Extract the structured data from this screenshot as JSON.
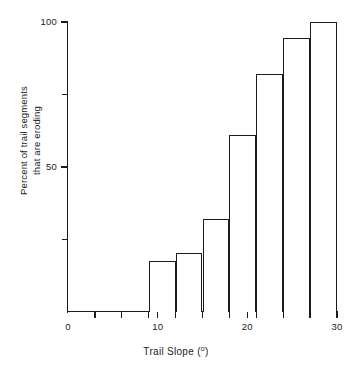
{
  "chart_data": {
    "type": "bar",
    "title": "",
    "xlabel": "Trail Slope (º)",
    "ylabel": "Percent of trail segments that are eroding",
    "ylabel_line1": "Percent of trail segments",
    "ylabel_line2": "that are eroding",
    "xlabel_text": "Trail Slope (",
    "xlabel_sup": "o",
    "xlabel_close": ")",
    "xlim": [
      0,
      30
    ],
    "ylim": [
      0,
      100
    ],
    "grid": false,
    "legend": null,
    "bin_width": 3,
    "x_tick_labels": [
      "0",
      "10",
      "20",
      "30"
    ],
    "x_tick_values": [
      0,
      10,
      20,
      30
    ],
    "x_minor_ticks": [
      3,
      6,
      9,
      12,
      15,
      18,
      21,
      24,
      27
    ],
    "y_tick_labels": [
      "100",
      "50"
    ],
    "y_tick_values": [
      100,
      50
    ],
    "y_minor_ticks": [
      75,
      25
    ],
    "categories": [
      "9-12",
      "12-15",
      "15-18",
      "18-21",
      "21-24",
      "24-27",
      "27-30"
    ],
    "bins": [
      {
        "x0": 9,
        "x1": 12,
        "value": 17.5
      },
      {
        "x0": 12,
        "x1": 15,
        "value": 20.5
      },
      {
        "x0": 15,
        "x1": 18,
        "value": 32.0
      },
      {
        "x0": 18,
        "x1": 21,
        "value": 61.0
      },
      {
        "x0": 21,
        "x1": 24,
        "value": 82.0
      },
      {
        "x0": 24,
        "x1": 27,
        "value": 94.5
      },
      {
        "x0": 27,
        "x1": 30,
        "value": 100.0
      }
    ],
    "values": [
      17.5,
      20.5,
      32.0,
      61.0,
      82.0,
      94.5,
      100.0
    ],
    "colors": {
      "bar_fill": "#ffffff",
      "bar_stroke": "#1c1c1c",
      "axis": "#1c1c1c",
      "text": "#1a1a1a",
      "background": "#ffffff"
    }
  }
}
